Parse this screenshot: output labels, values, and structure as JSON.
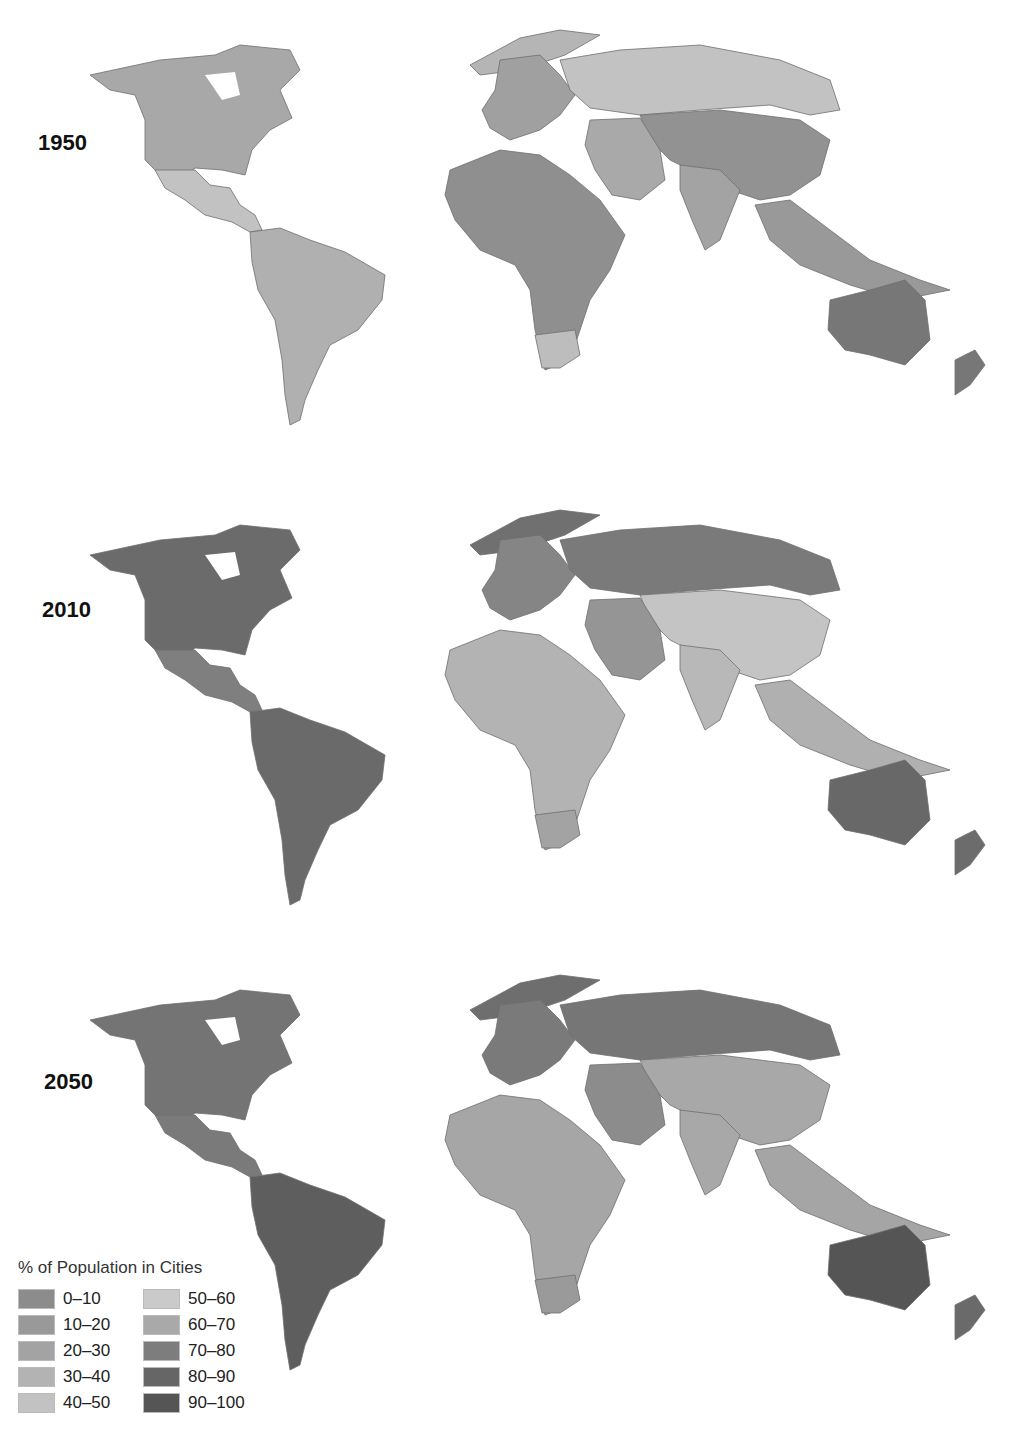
{
  "chart_data": {
    "type": "choropleth-map",
    "title": "% of Population in Cities",
    "panels": [
      {
        "year": "1950",
        "label": "1950"
      },
      {
        "year": "2010",
        "label": "2010"
      },
      {
        "year": "2050",
        "label": "2050"
      }
    ],
    "legend": {
      "title": "% of Population in Cities",
      "bins": [
        {
          "label": "0–10",
          "color": "#8c8c8c"
        },
        {
          "label": "10–20",
          "color": "#999999"
        },
        {
          "label": "20–30",
          "color": "#a3a3a3"
        },
        {
          "label": "30–40",
          "color": "#b3b3b3"
        },
        {
          "label": "40–50",
          "color": "#c2c2c2"
        },
        {
          "label": "50–60",
          "color": "#cacaca"
        },
        {
          "label": "60–70",
          "color": "#a9a9a9"
        },
        {
          "label": "70–80",
          "color": "#7d7d7d"
        },
        {
          "label": "80–90",
          "color": "#666666"
        },
        {
          "label": "90–100",
          "color": "#555555"
        }
      ]
    }
  },
  "panels": [
    {
      "label": "1950",
      "top": 0,
      "colors": {
        "na": "#a8a8a8",
        "greenland": "#b5b5b5",
        "mexico": "#c2c2c2",
        "sa": "#b0b0b0",
        "europe": "#a0a0a0",
        "russia": "#c2c2c2",
        "africa": "#8f8f8f",
        "southafrica": "#bdbdbd",
        "asia": "#929292",
        "mideast": "#a9a9a9",
        "india": "#a3a3a3",
        "australia": "#777777",
        "nz": "#777777",
        "sea": "#999999"
      }
    },
    {
      "label": "2010",
      "top": 480,
      "colors": {
        "na": "#6b6b6b",
        "greenland": "#707070",
        "mexico": "#7f7f7f",
        "sa": "#6a6a6a",
        "europe": "#858585",
        "russia": "#7a7a7a",
        "africa": "#b3b3b3",
        "southafrica": "#a3a3a3",
        "asia": "#c4c4c4",
        "mideast": "#959595",
        "india": "#b8b8b8",
        "australia": "#686868",
        "nz": "#6c6c6c",
        "sea": "#b0b0b0"
      }
    },
    {
      "label": "2050",
      "top": 945,
      "colors": {
        "na": "#747474",
        "greenland": "#6e6e6e",
        "mexico": "#7a7a7a",
        "sa": "#5e5e5e",
        "europe": "#7a7a7a",
        "russia": "#767676",
        "africa": "#a6a6a6",
        "southafrica": "#9a9a9a",
        "asia": "#a8a8a8",
        "mideast": "#8c8c8c",
        "india": "#a8a8a8",
        "australia": "#555555",
        "nz": "#6a6a6a",
        "sea": "#a5a5a5"
      }
    }
  ],
  "legend": {
    "title": "% of Population in Cities",
    "items": [
      {
        "label": "0–10",
        "color": "#8c8c8c"
      },
      {
        "label": "10–20",
        "color": "#999999"
      },
      {
        "label": "20–30",
        "color": "#a3a3a3"
      },
      {
        "label": "30–40",
        "color": "#b3b3b3"
      },
      {
        "label": "40–50",
        "color": "#c2c2c2"
      },
      {
        "label": "50–60",
        "color": "#cacaca"
      },
      {
        "label": "60–70",
        "color": "#a9a9a9"
      },
      {
        "label": "70–80",
        "color": "#7d7d7d"
      },
      {
        "label": "80–90",
        "color": "#666666"
      },
      {
        "label": "90–100",
        "color": "#555555"
      }
    ]
  }
}
